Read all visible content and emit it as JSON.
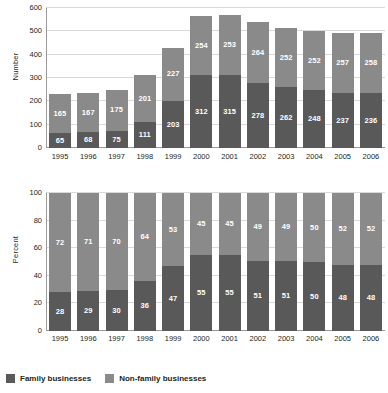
{
  "legend": {
    "items": [
      {
        "label": "Family businesses",
        "key": "family",
        "color": "#595959"
      },
      {
        "label": "Non-family businesses",
        "key": "nonfamily",
        "color": "#8a8a8a"
      }
    ]
  },
  "chart_data": [
    {
      "type": "bar",
      "subtype": "stacked-vertical",
      "title": "",
      "xlabel": "",
      "ylabel": "Number",
      "ylim": [
        0,
        600
      ],
      "yticks": [
        0,
        100,
        200,
        300,
        400,
        500,
        600
      ],
      "grid": true,
      "legend_position": "bottom",
      "categories": [
        "1995",
        "1996",
        "1997",
        "1998",
        "1999",
        "2000",
        "2001",
        "2002",
        "2003",
        "2004",
        "2005",
        "2006"
      ],
      "series": [
        {
          "name": "Family businesses",
          "color": "#595959",
          "values": [
            65,
            68,
            75,
            111,
            203,
            312,
            315,
            278,
            262,
            248,
            237,
            236
          ]
        },
        {
          "name": "Non-family businesses",
          "color": "#8a8a8a",
          "values": [
            165,
            167,
            175,
            201,
            227,
            254,
            253,
            264,
            252,
            252,
            257,
            258
          ]
        }
      ],
      "totals": [
        230,
        235,
        250,
        312,
        430,
        566,
        568,
        542,
        514,
        500,
        494,
        494
      ]
    },
    {
      "type": "bar",
      "subtype": "stacked-vertical-100",
      "title": "",
      "xlabel": "",
      "ylabel": "Percent",
      "ylim": [
        0,
        100
      ],
      "yticks": [
        0,
        20,
        40,
        60,
        80,
        100
      ],
      "grid": true,
      "legend_position": "bottom",
      "categories": [
        "1995",
        "1996",
        "1997",
        "1998",
        "1999",
        "2000",
        "2001",
        "2002",
        "2003",
        "2004",
        "2005",
        "2006"
      ],
      "series": [
        {
          "name": "Family businesses",
          "color": "#595959",
          "values": [
            28,
            29,
            30,
            36,
            47,
            55,
            55,
            51,
            51,
            50,
            48,
            48
          ]
        },
        {
          "name": "Non-family businesses",
          "color": "#8a8a8a",
          "values": [
            72,
            71,
            70,
            64,
            53,
            45,
            45,
            49,
            49,
            50,
            52,
            52
          ]
        }
      ]
    }
  ]
}
